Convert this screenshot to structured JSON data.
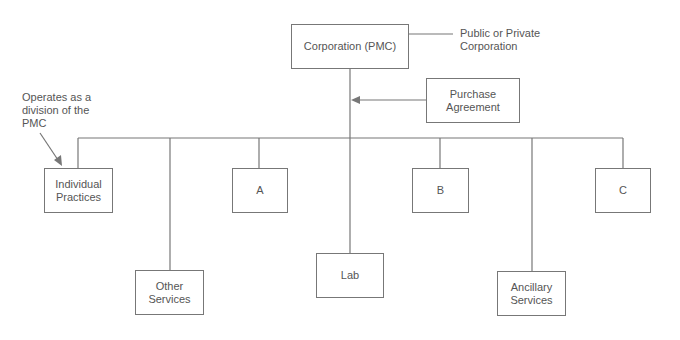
{
  "diagram": {
    "type": "org-chart",
    "root": {
      "label": "Corporation (PMC)"
    },
    "annotations": {
      "root_note": "Public or Private Corporation",
      "division_note": "Operates as a division of the PMC"
    },
    "agreement": {
      "label": "Purchase Agreement"
    },
    "children": [
      {
        "label": "Individual Practices"
      },
      {
        "label": "Other Services"
      },
      {
        "label": "A"
      },
      {
        "label": "Lab"
      },
      {
        "label": "B"
      },
      {
        "label": "Ancillary Services"
      },
      {
        "label": "C"
      }
    ],
    "colors": {
      "line": "#777777",
      "text": "#555555",
      "background": "#ffffff"
    }
  }
}
